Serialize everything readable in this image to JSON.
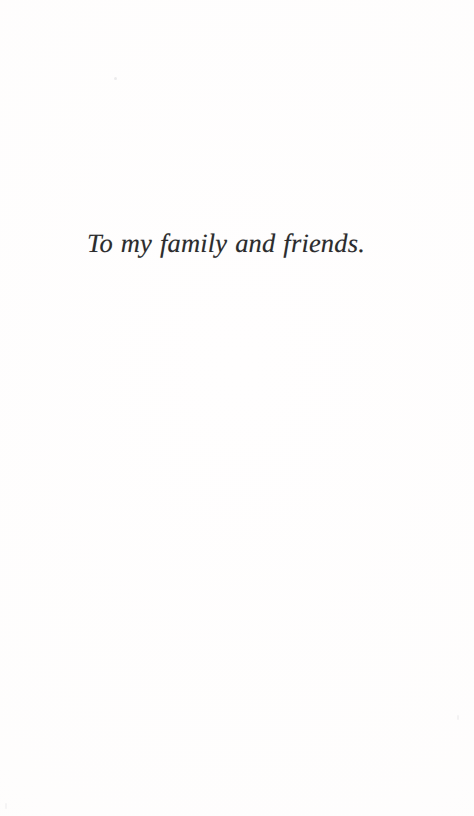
{
  "page": {
    "kind": "book-dedication-page",
    "width": 474,
    "height": 816,
    "background_color": "#fffefe",
    "text_color": "#2b2b2d"
  },
  "dedication": {
    "text": "To my family and friends.",
    "alignment": "center",
    "style": "italic-serif"
  },
  "artifacts": {
    "speck_upper_left": "",
    "speck_lower_right": "",
    "speck_bottom_left": ""
  }
}
